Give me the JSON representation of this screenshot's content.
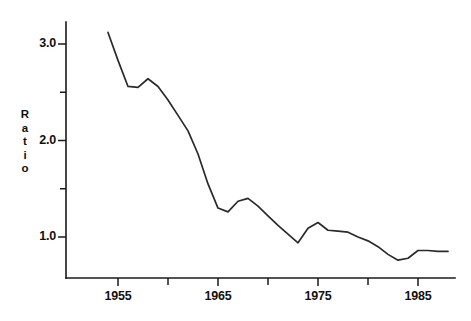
{
  "chart_data": {
    "type": "line",
    "title": "",
    "xlabel": "",
    "ylabel": "Ratio",
    "xlim": [
      1953.0,
      1988.5
    ],
    "ylim": [
      0.45,
      3.35
    ],
    "grid": false,
    "legend": null,
    "y_tick_labels": [
      "3.0",
      "2.0",
      "1.0"
    ],
    "y_major_ticks": [
      3.0,
      2.0,
      1.0
    ],
    "y_minor_ticks": [
      2.5,
      1.5
    ],
    "x_tick_labels": [
      "1955",
      "1965",
      "1975",
      "1985"
    ],
    "x_major_ticks": [
      1955,
      1965,
      1975,
      1985
    ],
    "x_minor_ticks": [
      1960,
      1970,
      1980
    ],
    "x": [
      1954,
      1955,
      1956,
      1957,
      1958,
      1959,
      1960,
      1961,
      1962,
      1963,
      1964,
      1965,
      1966,
      1967,
      1968,
      1969,
      1970,
      1971,
      1972,
      1973,
      1974,
      1975,
      1976,
      1977,
      1978,
      1979,
      1980,
      1981,
      1982,
      1983,
      1984,
      1985,
      1986,
      1987,
      1988
    ],
    "values": [
      3.12,
      2.83,
      2.56,
      2.55,
      2.64,
      2.56,
      2.42,
      2.26,
      2.1,
      1.86,
      1.55,
      1.3,
      1.26,
      1.37,
      1.4,
      1.32,
      1.22,
      1.12,
      1.03,
      0.94,
      1.09,
      1.15,
      1.07,
      1.06,
      1.05,
      1.0,
      0.96,
      0.9,
      0.82,
      0.76,
      0.78,
      0.86,
      0.86,
      0.85,
      0.85
    ],
    "series_name": "Ratio",
    "line_color": "#2a2a2a",
    "axis_color": "#1a1a1a",
    "background_color": "#ffffff"
  }
}
